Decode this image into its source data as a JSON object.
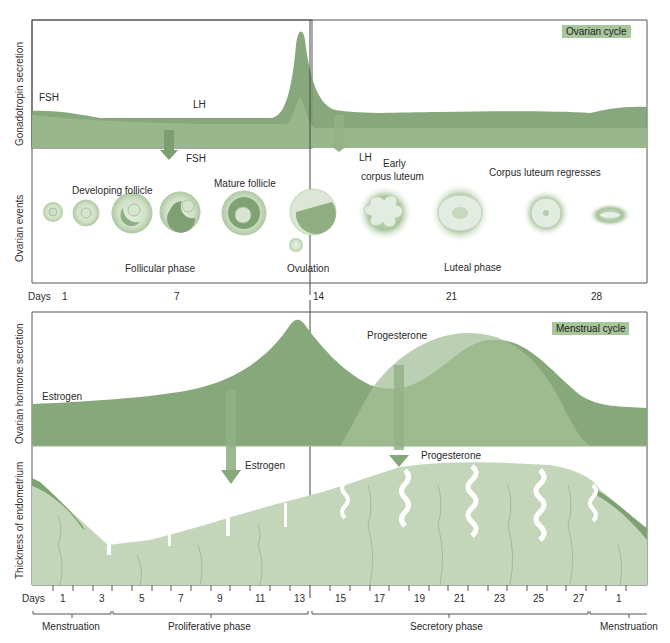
{
  "top_panel": {
    "tag": "Ovarian cycle",
    "y_axis_upper": "Gonadotropin secretion",
    "y_axis_lower": "Ovarian events",
    "hormones": {
      "fsh": "FSH",
      "lh": "LH"
    },
    "arrows": {
      "fsh": "FSH",
      "lh": "LH"
    },
    "stages": {
      "developing_follicle": "Developing follicle",
      "mature_follicle": "Mature follicle",
      "early_corpus_luteum_1": "Early",
      "early_corpus_luteum_2": "corpus luteum",
      "corpus_luteum_regresses": "Corpus luteum regresses"
    },
    "phases": {
      "follicular": "Follicular phase",
      "ovulation": "Ovulation",
      "luteal": "Luteal phase"
    },
    "days_label": "Days",
    "days_ticks": [
      "1",
      "7",
      "14",
      "21",
      "28"
    ]
  },
  "bottom_panel": {
    "tag": "Menstrual cycle",
    "y_axis_upper": "Ovarian hormone secretion",
    "y_axis_lower": "Thickness of endometrium",
    "hormones": {
      "estrogen": "Estrogen",
      "progesterone": "Progesterone"
    },
    "arrows": {
      "estrogen": "Estrogen",
      "progesterone": "Progesterone"
    },
    "days_label": "Days",
    "days_ticks": [
      "1",
      "3",
      "5",
      "7",
      "9",
      "11",
      "13",
      "15",
      "17",
      "19",
      "21",
      "23",
      "25",
      "27",
      "1"
    ],
    "phases": {
      "menstruation_1": "Menstruation",
      "proliferative": "Proliferative phase",
      "secretory": "Secretory phase",
      "menstruation_2": "Menstruation"
    }
  },
  "colors": {
    "green_dark": "#6f9563",
    "green_mid": "#8fb083",
    "green_light": "#b7cfaa",
    "tag_bg": "#a9c59b",
    "endometrium": "#c3d6ba"
  }
}
